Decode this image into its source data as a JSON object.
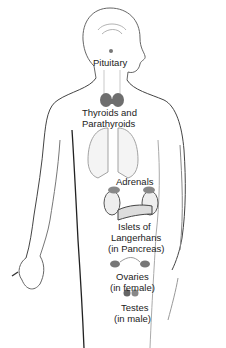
{
  "diagram": {
    "labels": {
      "pituitary": "Pituitary",
      "thyroids_line1": "Thyroids and",
      "thyroids_line2": "Parathyroids",
      "adrenals": "Adrenals",
      "islets_line1": "Islets of",
      "islets_line2": "Langerhans",
      "islets_line3": "(in Pancreas)",
      "ovaries_line1": "Ovaries",
      "ovaries_line2": "(in female)",
      "testes_line1": "Testes",
      "testes_line2": "(in male)"
    },
    "colors": {
      "outline": "#333333",
      "gland": "#8a8a8a",
      "organ_fill": "#f2f2f2",
      "text": "#222222"
    }
  }
}
